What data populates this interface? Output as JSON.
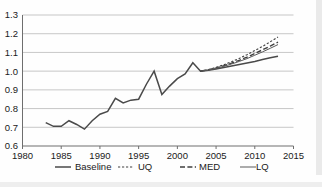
{
  "chart_data": {
    "type": "line",
    "title": "",
    "xlabel": "",
    "ylabel": "",
    "xlim": [
      1980,
      2015
    ],
    "ylim": [
      0.6,
      1.3
    ],
    "grid": true,
    "legend_position": "bottom",
    "xticks": [
      "1980",
      "1985",
      "1990",
      "1995",
      "2000",
      "2005",
      "2010",
      "2015"
    ],
    "yticks": [
      "0.6",
      "0.7",
      "0.8",
      "0.9",
      "1.0",
      "1.1",
      "1.2",
      "1.3"
    ],
    "series": [
      {
        "name": "Baseline",
        "style": "solid-thick",
        "x": [
          1983,
          1984,
          1985,
          1986,
          1987,
          1988,
          1989,
          1990,
          1991,
          1992,
          1993,
          1994,
          1995,
          1996,
          1997,
          1998,
          1999,
          2000,
          2001,
          2002,
          2003,
          2004,
          2005,
          2006,
          2007,
          2008,
          2009,
          2010,
          2011,
          2012,
          2013
        ],
        "values": [
          0.725,
          0.705,
          0.705,
          0.735,
          0.715,
          0.69,
          0.735,
          0.77,
          0.785,
          0.855,
          0.83,
          0.845,
          0.85,
          0.93,
          1.0,
          0.875,
          0.92,
          0.96,
          0.985,
          1.045,
          1.0,
          1.005,
          1.012,
          1.02,
          1.028,
          1.036,
          1.044,
          1.052,
          1.062,
          1.072,
          1.08
        ]
      },
      {
        "name": "UQ",
        "style": "dotted",
        "x": [
          2003,
          2004,
          2005,
          2006,
          2007,
          2008,
          2009,
          2010,
          2011,
          2012,
          2013
        ],
        "values": [
          1.0,
          1.008,
          1.02,
          1.034,
          1.05,
          1.068,
          1.088,
          1.11,
          1.132,
          1.157,
          1.182
        ]
      },
      {
        "name": "MED",
        "style": "dashed",
        "x": [
          2003,
          2004,
          2005,
          2006,
          2007,
          2008,
          2009,
          2010,
          2011,
          2012,
          2013
        ],
        "values": [
          1.0,
          1.007,
          1.017,
          1.029,
          1.043,
          1.058,
          1.075,
          1.094,
          1.114,
          1.134,
          1.155
        ]
      },
      {
        "name": "LQ",
        "style": "solid-thin",
        "x": [
          2003,
          2004,
          2005,
          2006,
          2007,
          2008,
          2009,
          2010,
          2011,
          2012,
          2013
        ],
        "values": [
          1.0,
          1.006,
          1.015,
          1.026,
          1.038,
          1.052,
          1.067,
          1.085,
          1.103,
          1.122,
          1.142
        ]
      }
    ]
  },
  "legend": {
    "items": [
      {
        "label": "Baseline",
        "style": "solid-thick"
      },
      {
        "label": "UQ",
        "style": "dotted"
      },
      {
        "label": "MED",
        "style": "dashed"
      },
      {
        "label": "LQ",
        "style": "solid-thin"
      }
    ]
  },
  "colors": {
    "line": "#4a4a4a",
    "grid": "#b9b9b9",
    "axis": "#6e6e6e",
    "text": "#1a1a1a",
    "background": "#fefefe"
  }
}
